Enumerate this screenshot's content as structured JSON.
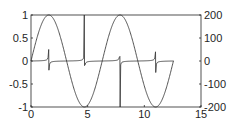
{
  "chart_data": {
    "type": "line",
    "title": "",
    "xlabel": "",
    "ylabel_left": "",
    "ylabel_right": "",
    "xlim": [
      0,
      15
    ],
    "ylim_left": [
      -1,
      1
    ],
    "ylim_right": [
      -200,
      200
    ],
    "xticks": [
      "0",
      "5",
      "10",
      "15"
    ],
    "yticks_left": [
      "1",
      "0.5",
      "0",
      "-0.5",
      "-1"
    ],
    "yticks_right": [
      "200",
      "100",
      "0",
      "-100",
      "-200"
    ],
    "grid": false,
    "legend": null,
    "series": [
      {
        "name": "sin(x)",
        "axis": "left",
        "x_range": [
          0,
          12.57
        ],
        "function": "sin",
        "color": "#404040"
      },
      {
        "name": "tan(x)",
        "axis": "right",
        "x_range": [
          0,
          12.57
        ],
        "function": "tan",
        "color": "#404040",
        "spikes": [
          {
            "x": 1.571,
            "up": 50,
            "down": -40
          },
          {
            "x": 4.712,
            "up": 200,
            "down": -20
          },
          {
            "x": 7.854,
            "up": 20,
            "down": -200
          },
          {
            "x": 10.996,
            "up": 40,
            "down": -50
          }
        ]
      }
    ]
  },
  "colors": {
    "axis": "#262626",
    "line": "#404040",
    "background": "#ffffff"
  }
}
